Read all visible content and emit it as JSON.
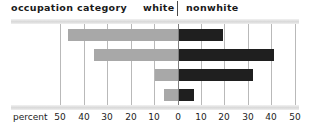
{
  "header": {
    "occupation_label": "occupation category",
    "white_label": "white",
    "nonwhite_label": "nonwhite"
  },
  "axis": {
    "title": "percent"
  },
  "colors": {
    "white_bar": "#a8a8a8",
    "nonwhite_bar": "#1f1f1f",
    "gridline": "#b9b9b9",
    "zero_line": "#7d7d7d",
    "band": "#d8d8d8",
    "text": "#1c1c1c"
  },
  "chart_data": {
    "type": "bar",
    "orientation": "horizontal-diverging",
    "title": "occupation category",
    "xlabel": "percent",
    "ylabel": "",
    "categories": [
      "white collar",
      "blue collar",
      "service",
      "farm"
    ],
    "series": [
      {
        "name": "white",
        "side": "left",
        "values": [
          47,
          36,
          10,
          6
        ]
      },
      {
        "name": "nonwhite",
        "side": "right",
        "values": [
          19,
          41,
          32,
          7
        ]
      }
    ],
    "xlim": [
      -50,
      50
    ],
    "xticks": [
      -50,
      -40,
      -30,
      -20,
      -10,
      0,
      10,
      20,
      30,
      40,
      50
    ],
    "xtick_labels": [
      "50",
      "40",
      "30",
      "20",
      "10",
      "0",
      "10",
      "20",
      "30",
      "40",
      "50"
    ],
    "grid": true,
    "legend": "header"
  }
}
